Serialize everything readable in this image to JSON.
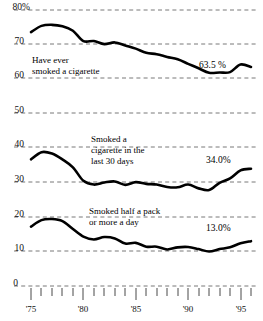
{
  "chart_data": {
    "type": "line",
    "title": "",
    "subtitle": "",
    "xlabel": "",
    "ylabel": "",
    "ylim": [
      0,
      80
    ],
    "xlim": [
      1975,
      1996
    ],
    "grid": true,
    "grid_style": "dashed-horizontal",
    "legend": "inline-annotations",
    "y_ticks": [
      "0",
      "10",
      "20",
      "30",
      "40",
      "50",
      "60",
      "70",
      "80%"
    ],
    "y_tick_values": [
      0,
      10,
      20,
      30,
      40,
      50,
      60,
      70,
      80
    ],
    "x_ticks": [
      "'75",
      "'80",
      "'85",
      "'90",
      "'95"
    ],
    "x_tick_values": [
      1975,
      1980,
      1985,
      1990,
      1995
    ],
    "x_minor_every": 1,
    "x": [
      1975,
      1976,
      1977,
      1978,
      1979,
      1980,
      1981,
      1982,
      1983,
      1984,
      1985,
      1986,
      1987,
      1988,
      1989,
      1990,
      1991,
      1992,
      1993,
      1994,
      1995,
      1996
    ],
    "series": [
      {
        "name": "Have ever smoked a cigarette",
        "annotation": "Have ever\nsmoked a cigarette",
        "annotation_lines": [
          "Have ever",
          "smoked a cigarette"
        ],
        "end_label": "63.5 %",
        "end_value": 63.5,
        "color": "#000000",
        "values": [
          73.6,
          75.4,
          75.7,
          75.3,
          74.0,
          71.0,
          71.0,
          70.1,
          70.6,
          69.7,
          68.8,
          67.6,
          67.2,
          66.4,
          65.7,
          64.4,
          63.1,
          61.8,
          61.9,
          62.0,
          64.2,
          63.5
        ]
      },
      {
        "name": "Smoked a cigarette in the last 30 days",
        "annotation": "Smoked a\ncigarette in the\nlast 30 days",
        "annotation_lines": [
          "Smoked a",
          "cigarette in the",
          "last 30 days"
        ],
        "end_label": "34.0%",
        "end_value": 34.0,
        "color": "#000000",
        "values": [
          36.7,
          38.8,
          38.4,
          36.7,
          34.4,
          30.5,
          29.4,
          30.0,
          30.3,
          29.3,
          30.1,
          29.6,
          29.4,
          28.7,
          28.6,
          29.4,
          28.3,
          27.8,
          29.9,
          31.2,
          33.5,
          34.0
        ]
      },
      {
        "name": "Smoked half a pack or more a day",
        "annotation": "Smoked half a pack\nor more a day",
        "annotation_lines": [
          "Smoked half a pack",
          "or more a day"
        ],
        "end_label": "13.0%",
        "end_value": 13.0,
        "color": "#000000",
        "values": [
          17.2,
          19.1,
          19.4,
          18.8,
          16.5,
          14.3,
          13.5,
          14.2,
          13.8,
          12.3,
          12.5,
          11.4,
          11.4,
          10.6,
          11.2,
          11.3,
          10.7,
          10.0,
          10.7,
          11.2,
          12.4,
          13.0
        ]
      }
    ]
  },
  "axis": {
    "y": {
      "t80": "80%",
      "t70": "70",
      "t60": "60",
      "t50": "50",
      "t40": "40",
      "t30": "30",
      "t20": "20",
      "t10": "10",
      "t0": "0"
    },
    "x": {
      "t75": "'75",
      "t80": "'80",
      "t85": "'85",
      "t90": "'90",
      "t95": "'95"
    }
  },
  "annotations": {
    "ever_line1": "Have ever",
    "ever_line2": "smoked a cigarette",
    "ever_value": "63.5 %",
    "last30_line1": "Smoked a",
    "last30_line2": "cigarette in the",
    "last30_line3": "last 30 days",
    "last30_value": "34.0%",
    "halfpack_line1": "Smoked half a pack",
    "halfpack_line2": "or more a day",
    "halfpack_value": "13.0%"
  },
  "style": {
    "line_color": "#000000",
    "grid_color": "#555555",
    "text_color": "#111111",
    "background": "#ffffff"
  }
}
